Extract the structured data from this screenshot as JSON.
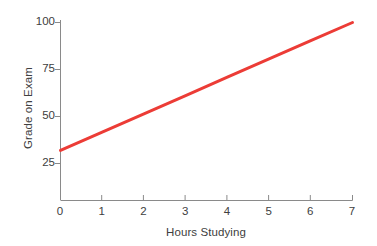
{
  "chart_data": {
    "type": "line",
    "title": "",
    "xlabel": "Hours Studying",
    "ylabel": "Grade on Exam",
    "xlim": [
      0,
      7
    ],
    "ylim": [
      0,
      100
    ],
    "grid": false,
    "legend": false,
    "xticks": [
      "0",
      "1",
      "2",
      "3",
      "4",
      "5",
      "6",
      "7"
    ],
    "xtick_values": [
      0,
      1,
      2,
      3,
      4,
      5,
      6,
      7
    ],
    "yticks": [
      "25",
      "50",
      "75",
      "100"
    ],
    "ytick_values": [
      25,
      50,
      75,
      100
    ],
    "series": [
      {
        "name": "Predicted grade",
        "color": "#ec3c36",
        "line_width": 3,
        "x": [
          0,
          1,
          2,
          3,
          4,
          5,
          6,
          7
        ],
        "values": [
          32,
          41.7,
          51.4,
          61.1,
          70.9,
          80.6,
          90.3,
          100
        ]
      }
    ],
    "annotations": []
  },
  "axis": {
    "line_color": "#8a8a8a",
    "tick_color": "#8a8a8a"
  },
  "background": "#ffffff"
}
